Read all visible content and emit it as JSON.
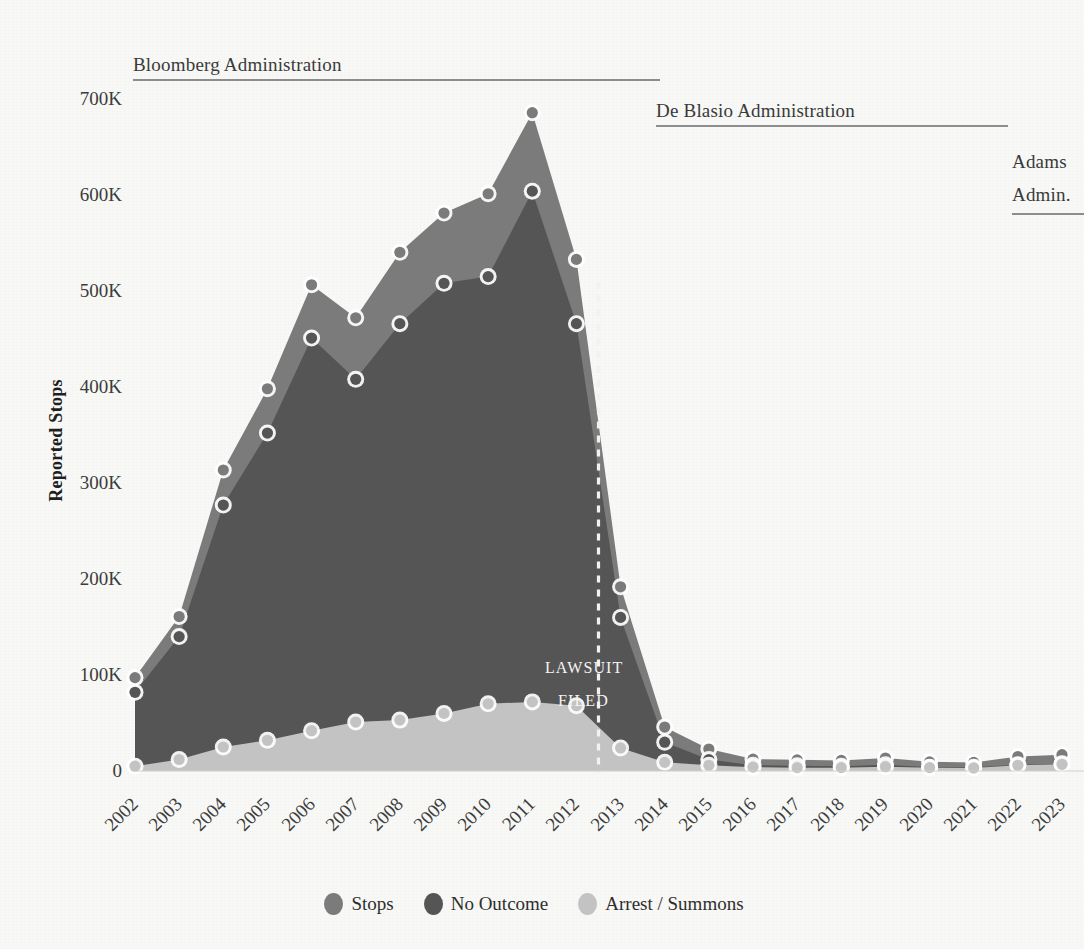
{
  "axes": {
    "ylabel": "Reported Stops",
    "yticks": [
      "700K",
      "600K",
      "500K",
      "400K",
      "300K",
      "200K",
      "100K",
      "0"
    ],
    "ytick_values": [
      700000,
      600000,
      500000,
      400000,
      300000,
      200000,
      100000,
      0
    ]
  },
  "annotations": {
    "bloomberg": "Bloomberg Administration",
    "deblasio": "De Blasio Administration",
    "adams_line1": "Adams",
    "adams_line2": "Admin.",
    "lawsuit_line1": "LAWSUIT",
    "lawsuit_line2": "FILED",
    "lawsuit_year": 2012.5
  },
  "legend": [
    {
      "label": "Stops",
      "color": "#7b7b7b"
    },
    {
      "label": "No Outcome",
      "color": "#555555"
    },
    {
      "label": "Arrest / Summons",
      "color": "#c3c3c3"
    }
  ],
  "chart_data": {
    "type": "area",
    "title": "",
    "xlabel": "",
    "ylabel": "Reported Stops",
    "categories": [
      "2002",
      "2003",
      "2004",
      "2005",
      "2006",
      "2007",
      "2008",
      "2009",
      "2010",
      "2011",
      "2012",
      "2013",
      "2014",
      "2015",
      "2016",
      "2017",
      "2018",
      "2019",
      "2020",
      "2021",
      "2022",
      "2023"
    ],
    "ylim": [
      0,
      700000
    ],
    "xlim": [
      "2002",
      "2023"
    ],
    "grid": false,
    "legend_position": "bottom",
    "series": [
      {
        "name": "Stops",
        "color": "#7b7b7b",
        "values": [
          97296,
          160851,
          313523,
          398191,
          506491,
          472096,
          540302,
          581168,
          601285,
          685724,
          532911,
          191851,
          45787,
          22939,
          12404,
          11629,
          11008,
          13459,
          9544,
          8947,
          15102,
          16971
        ]
      },
      {
        "name": "No Outcome",
        "color": "#555555",
        "values": [
          82000,
          140000,
          277000,
          352000,
          451000,
          408000,
          466000,
          508000,
          515000,
          604000,
          466000,
          160000,
          30000,
          12000,
          6000,
          5500,
          5000,
          6500,
          4000,
          3800,
          6500,
          7500
        ]
      },
      {
        "name": "Arrest / Summons",
        "color": "#c3c3c3",
        "values": [
          5000,
          12000,
          25000,
          32000,
          42000,
          51000,
          53000,
          60000,
          70000,
          72000,
          68000,
          24000,
          9000,
          6000,
          4000,
          3500,
          3500,
          4500,
          3500,
          3200,
          6000,
          7000
        ]
      }
    ]
  }
}
